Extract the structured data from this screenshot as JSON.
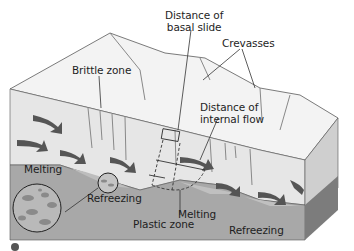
{
  "diagram": {
    "labels": {
      "distance_basal_slide_line1": "Distance of",
      "distance_basal_slide_line2": "basal slide",
      "crevasses": "Crevasses",
      "brittle_zone": "Brittle zone",
      "distance_internal_flow_line1": "Distance of",
      "distance_internal_flow_line2": "internal flow",
      "melting_left": "Melting",
      "refreezing_left": "Refreezing",
      "plastic_zone": "Plastic zone",
      "melting_right": "Melting",
      "refreezing_right": "Refreezing"
    },
    "colors": {
      "ice_top": "#f2f2f2",
      "ice_front": "#e4e4e4",
      "ice_side": "#c8c8c8",
      "bedrock_front": "#a6a6a6",
      "bedrock_side": "#7a7a7a",
      "arrow": "#555555",
      "outline": "#333333",
      "text": "#1e1e1e"
    },
    "footer_caption": ""
  }
}
